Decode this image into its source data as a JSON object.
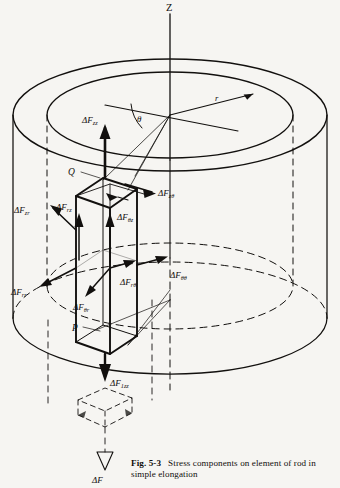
{
  "figure": {
    "number": "Fig. 5-3",
    "caption_line1": "Stress components on element",
    "caption_line2": "of rod in simple elongation",
    "background_color": "#f6f5f2",
    "ink_color": "#12100e"
  },
  "axes": {
    "vertical_axis_label": "Z",
    "radius_label": "r",
    "angle_label": "θ"
  },
  "points": {
    "top_corner_label": "Q",
    "bottom_corner_label": "P"
  },
  "force_labels": {
    "zz": {
      "delta": "ΔF",
      "sub": "zz"
    },
    "ztheta": {
      "delta": "ΔF",
      "sub": "zθ"
    },
    "zr": {
      "delta": "ΔF",
      "sub": "zr"
    },
    "rz": {
      "delta": "ΔF",
      "sub": "rz"
    },
    "thetaz": {
      "delta": "ΔF",
      "sub": "θz"
    },
    "rr": {
      "delta": "ΔF",
      "sub": "rr"
    },
    "thetar": {
      "delta": "ΔF",
      "sub": "θr"
    },
    "rtheta": {
      "delta": "ΔF",
      "sub": "rθ"
    },
    "thetatheta": {
      "delta": "ΔF",
      "sub": "θθ"
    },
    "bottom_zz": {
      "delta": "ΔF",
      "sub": "1zz"
    },
    "resultant": {
      "delta": "ΔF",
      "sub": ""
    }
  }
}
